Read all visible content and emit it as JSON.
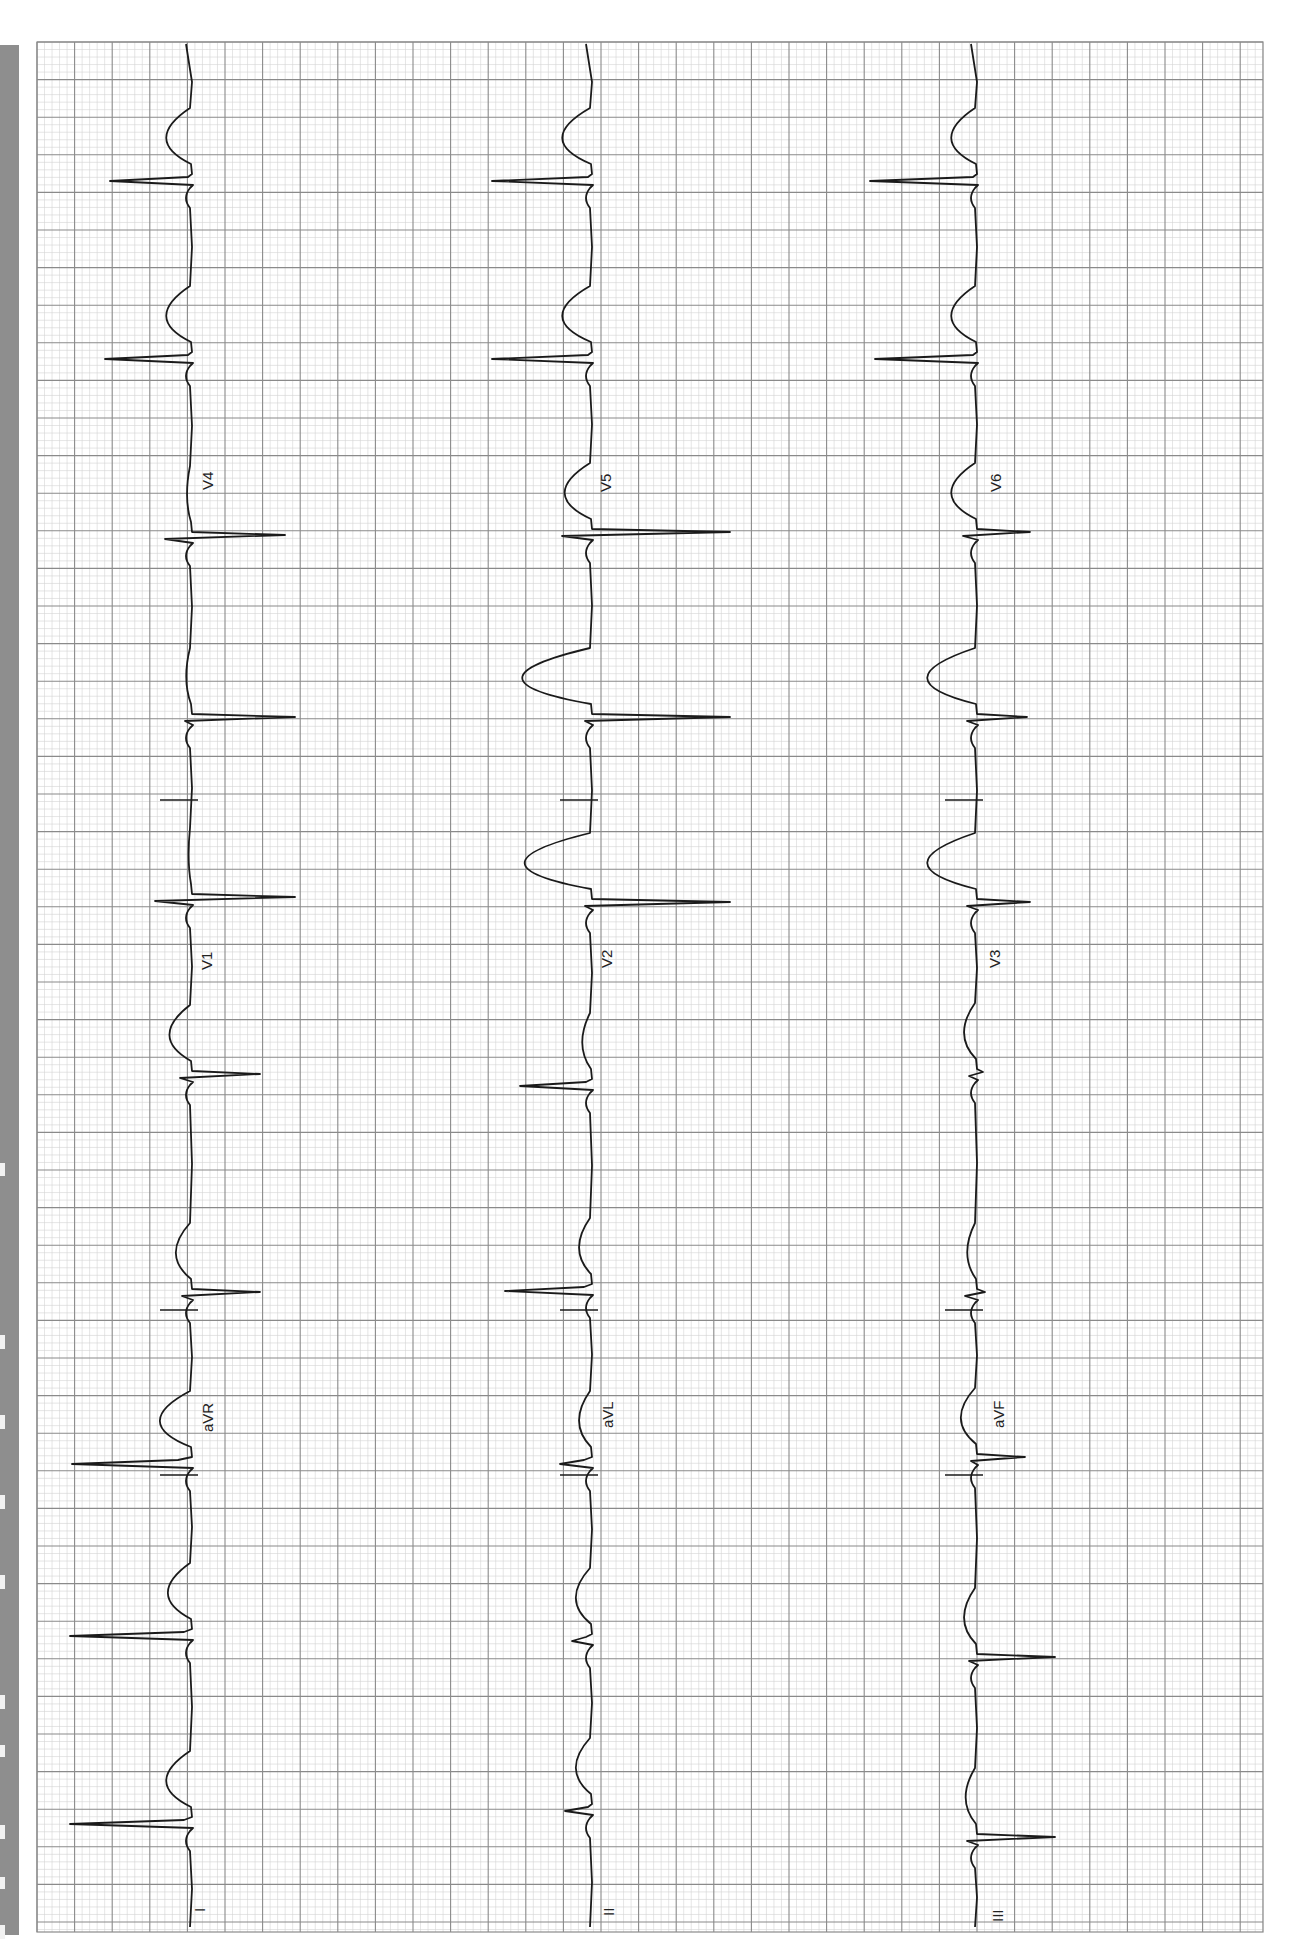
{
  "chart_data": {
    "type": "line",
    "title": "",
    "orientation": "rotated-90",
    "grid": {
      "on": true,
      "major_spacing_px": 37.6,
      "minor_per_major": 5,
      "major_color": "#8a8a8a",
      "minor_color": "#d4d4d4",
      "left": 37,
      "top": 42,
      "right": 1263,
      "bottom": 1932
    },
    "leads": [
      {
        "row": 1,
        "name": "I",
        "label_y": 1905,
        "baseline_x": 190
      },
      {
        "row": 1,
        "name": "aVR",
        "label_y": 1420,
        "baseline_x": 190
      },
      {
        "row": 1,
        "name": "V1",
        "label_y": 960,
        "baseline_x": 190
      },
      {
        "row": 1,
        "name": "V4",
        "label_y": 478,
        "baseline_x": 190
      },
      {
        "row": 2,
        "name": "II",
        "label_y": 1905,
        "baseline_x": 590
      },
      {
        "row": 2,
        "name": "aVL",
        "label_y": 1420,
        "baseline_x": 590
      },
      {
        "row": 2,
        "name": "V2",
        "label_y": 960,
        "baseline_x": 590
      },
      {
        "row": 2,
        "name": "V5",
        "label_y": 478,
        "baseline_x": 590
      },
      {
        "row": 3,
        "name": "III",
        "label_y": 1905,
        "baseline_x": 975
      },
      {
        "row": 3,
        "name": "aVF",
        "label_y": 1420,
        "baseline_x": 975
      },
      {
        "row": 3,
        "name": "V3",
        "label_y": 960,
        "baseline_x": 975
      },
      {
        "row": 3,
        "name": "V6",
        "label_y": 478,
        "baseline_x": 975
      }
    ],
    "series": [
      {
        "name": "Row 1 (I / aVR / V1 / V4)",
        "baseline_x": 190,
        "beats": [
          {
            "qrs_y": 1823,
            "lead": "I",
            "r": 120,
            "s": -6,
            "t": -30
          },
          {
            "qrs_y": 1635,
            "lead": "I",
            "r": 120,
            "s": -6,
            "t": -28
          },
          {
            "qrs_y": 1463,
            "lead": "aVR",
            "r": 118,
            "s": -12,
            "t": -38
          },
          {
            "qrs_y": 1295,
            "lead": "V1",
            "r": 8,
            "s": 70,
            "t": -18
          },
          {
            "qrs_y": 1077,
            "lead": "V1",
            "r": 10,
            "s": 70,
            "t": -26
          },
          {
            "qrs_y": 900,
            "lead": "V1",
            "r": 35,
            "s": 105,
            "t": -2
          },
          {
            "qrs_y": 720,
            "lead": "V1",
            "r": 5,
            "s": 105,
            "t": -5
          },
          {
            "qrs_y": 538,
            "lead": "V4",
            "r": 25,
            "s": 95,
            "t": -4
          },
          {
            "qrs_y": 358,
            "lead": "V4",
            "r": 85,
            "s": -2,
            "t": -30
          },
          {
            "qrs_y": 180,
            "lead": "V4",
            "r": 80,
            "s": -2,
            "t": -30
          }
        ]
      },
      {
        "name": "Row 2 (II / aVL / V2 / V5)",
        "baseline_x": 590,
        "beats": [
          {
            "qrs_y": 1810,
            "lead": "II",
            "r": 25,
            "s": -2,
            "t": -18
          },
          {
            "qrs_y": 1640,
            "lead": "II",
            "r": 18,
            "s": -4,
            "t": -18
          },
          {
            "qrs_y": 1463,
            "lead": "aVL",
            "r": 30,
            "s": -6,
            "t": -14
          },
          {
            "qrs_y": 1290,
            "lead": "aVL",
            "r": 85,
            "s": -6,
            "t": -14
          },
          {
            "qrs_y": 1085,
            "lead": "V2",
            "r": 70,
            "s": -4,
            "t": -10
          },
          {
            "qrs_y": 905,
            "lead": "V2",
            "r": 5,
            "s": 140,
            "t": -82
          },
          {
            "qrs_y": 720,
            "lead": "V2",
            "r": 5,
            "s": 140,
            "t": -85
          },
          {
            "qrs_y": 535,
            "lead": "V5",
            "r": 28,
            "s": 140,
            "t": -32
          },
          {
            "qrs_y": 358,
            "lead": "V5",
            "r": 98,
            "s": -2,
            "t": -35
          },
          {
            "qrs_y": 180,
            "lead": "V5",
            "r": 98,
            "s": -2,
            "t": -35
          }
        ]
      },
      {
        "name": "Row 3 (III / aVF / V3 / V6)",
        "baseline_x": 975,
        "beats": [
          {
            "qrs_y": 1840,
            "lead": "III",
            "r": 8,
            "s": 80,
            "t": -12
          },
          {
            "qrs_y": 1660,
            "lead": "III",
            "r": 6,
            "s": 80,
            "t": -14
          },
          {
            "qrs_y": 1460,
            "lead": "aVF",
            "r": 4,
            "s": 50,
            "t": -18
          },
          {
            "qrs_y": 1295,
            "lead": "aVF",
            "r": 10,
            "s": 10,
            "t": -10
          },
          {
            "qrs_y": 1075,
            "lead": "aVF",
            "r": 6,
            "s": 8,
            "t": -14
          },
          {
            "qrs_y": 905,
            "lead": "V3",
            "r": 8,
            "s": 55,
            "t": -60
          },
          {
            "qrs_y": 720,
            "lead": "V3",
            "r": 8,
            "s": 52,
            "t": -60
          },
          {
            "qrs_y": 535,
            "lead": "V6",
            "r": 12,
            "s": 55,
            "t": -30
          },
          {
            "qrs_y": 358,
            "lead": "V6",
            "r": 100,
            "s": -2,
            "t": -30
          },
          {
            "qrs_y": 180,
            "lead": "V6",
            "r": 105,
            "s": -2,
            "t": -30
          }
        ]
      }
    ],
    "xlabel": "",
    "ylabel": "",
    "legend": "none"
  },
  "labels": {
    "I": "I",
    "aVR": "aVR",
    "V1": "V1",
    "V4": "V4",
    "II": "II",
    "aVL": "aVL",
    "V2": "V2",
    "V5": "V5",
    "III": "III",
    "aVF": "aVF",
    "V3": "V3",
    "V6": "V6"
  },
  "colors": {
    "trace": "#1a1a1a",
    "grid_major": "#8a8a8a",
    "grid_minor": "#d4d4d4",
    "paper": "#ffffff",
    "side_bar": "#8e8e8e"
  }
}
